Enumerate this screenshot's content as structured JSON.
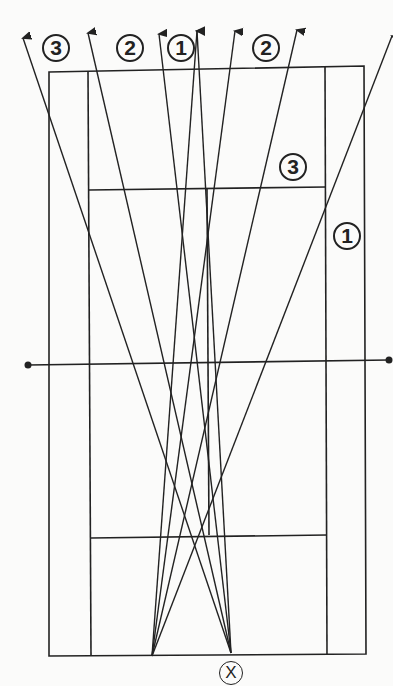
{
  "diagram": {
    "type": "badminton court shot direction diagram",
    "line_color": "#222222",
    "labels": [
      {
        "id": "top-3",
        "text": "3",
        "x": 42,
        "y": 34
      },
      {
        "id": "top-2a",
        "text": "2",
        "x": 116,
        "y": 34
      },
      {
        "id": "top-1",
        "text": "1",
        "x": 167,
        "y": 34
      },
      {
        "id": "top-2b",
        "text": "2",
        "x": 252,
        "y": 34
      },
      {
        "id": "right-3",
        "text": "3",
        "x": 279,
        "y": 153
      },
      {
        "id": "right-1",
        "text": "1",
        "x": 333,
        "y": 222
      }
    ],
    "player_marker": {
      "text": "X",
      "x": 219,
      "y": 661
    }
  }
}
